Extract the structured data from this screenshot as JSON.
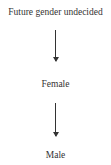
{
  "diagram": {
    "type": "flow",
    "direction": "top-to-bottom",
    "nodes": [
      {
        "id": "n1",
        "label": "Future gender undecided"
      },
      {
        "id": "n2",
        "label": "Female"
      },
      {
        "id": "n3",
        "label": "Male"
      }
    ],
    "edges": [
      {
        "from": "n1",
        "to": "n2"
      },
      {
        "from": "n2",
        "to": "n3"
      }
    ]
  }
}
